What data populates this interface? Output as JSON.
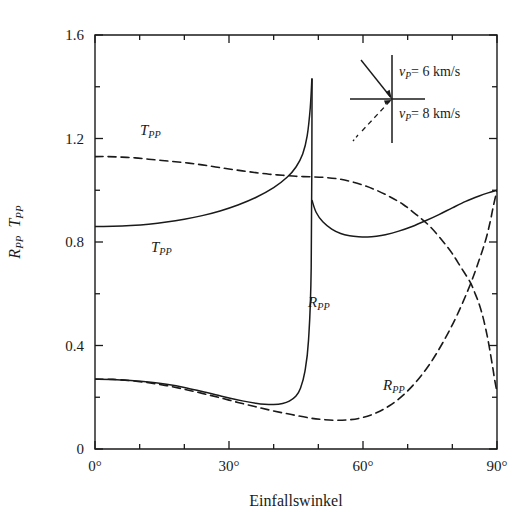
{
  "figure": {
    "background": "#ffffff",
    "ink_color": "#1a1a1a"
  },
  "axes": {
    "x_title": "Einfallswinkel",
    "y_title_r": "R",
    "y_title_r_sub": "PP",
    "y_title_t": "T",
    "y_title_t_sub": "PP",
    "x_tick_labels": [
      "0°",
      "30°",
      "60°",
      "90°"
    ],
    "y_tick_labels": [
      "0",
      "0.4",
      "0.8",
      "1.2",
      "1.6"
    ]
  },
  "curve_labels": {
    "t_pp_dashed": {
      "base": "T",
      "sub": "PP"
    },
    "t_pp_solid": {
      "base": "T",
      "sub": "PP"
    },
    "r_pp_solid": {
      "base": "R",
      "sub": "PP"
    },
    "r_pp_dashed": {
      "base": "R",
      "sub": "PP"
    }
  },
  "legend": {
    "upper_medium": {
      "symbol": "v",
      "symbol_sub": "P",
      "equals": "=",
      "value": "6 km/s"
    },
    "lower_medium": {
      "symbol": "v",
      "symbol_sub": "P",
      "equals": "=",
      "value": "8 km/s"
    }
  },
  "chart_data": {
    "type": "line",
    "title": "",
    "xlabel": "Einfallswinkel",
    "ylabel": "R_PP  T_PP",
    "xlim": [
      0,
      90
    ],
    "ylim": [
      0,
      1.6
    ],
    "xticks": [
      0,
      30,
      60,
      90
    ],
    "xtick_labels": [
      "0°",
      "30°",
      "60°",
      "90°"
    ],
    "xticks_minor": [
      10,
      20,
      40,
      50,
      70,
      80
    ],
    "yticks": [
      0,
      0.4,
      0.8,
      1.2,
      1.6
    ],
    "ytick_labels": [
      "0",
      "0.4",
      "0.8",
      "1.2",
      "1.6"
    ],
    "yticks_minor": [
      0.2,
      0.6,
      1.0,
      1.4
    ],
    "grid": false,
    "legend_position": "inside-top-right",
    "annotations": [
      {
        "text": "T_PP",
        "x": 10.5,
        "y": 1.225,
        "style": "dashed-curve-label"
      },
      {
        "text": "T_PP",
        "x": 13.0,
        "y": 0.775,
        "style": "solid-curve-label"
      },
      {
        "text": "R_PP",
        "x": 47.5,
        "y": 0.535,
        "style": "solid-curve-label"
      },
      {
        "text": "R_PP",
        "x": 70.0,
        "y": 0.255,
        "style": "dashed-curve-label"
      }
    ],
    "critical_angle_deg": 48.6,
    "series": [
      {
        "name": "T_PP (v_P = 8 km/s, dashed)",
        "style": "dashed",
        "x": [
          0,
          3,
          6,
          9,
          12,
          15,
          18,
          21,
          24,
          27,
          30,
          33,
          36,
          39,
          42,
          45,
          48,
          51,
          54,
          57,
          60,
          63,
          66,
          69,
          72,
          75,
          78,
          80,
          82,
          84,
          85,
          86,
          87,
          88,
          89,
          89.5,
          90
        ],
        "y": [
          1.13,
          1.13,
          1.128,
          1.125,
          1.12,
          1.115,
          1.11,
          1.105,
          1.098,
          1.09,
          1.082,
          1.075,
          1.068,
          1.062,
          1.058,
          1.054,
          1.052,
          1.05,
          1.045,
          1.035,
          1.02,
          1.0,
          0.975,
          0.945,
          0.905,
          0.86,
          0.8,
          0.755,
          0.7,
          0.645,
          0.605,
          0.56,
          0.5,
          0.42,
          0.32,
          0.265,
          0.22
        ]
      },
      {
        "name": "T_PP (v_P = 6 km/s, solid)",
        "style": "solid",
        "x": [
          0,
          4,
          8,
          12,
          16,
          20,
          24,
          28,
          32,
          36,
          40,
          43,
          45,
          46.5,
          47.5,
          48.2,
          48.55
        ],
        "y": [
          0.86,
          0.861,
          0.864,
          0.869,
          0.877,
          0.888,
          0.902,
          0.92,
          0.943,
          0.972,
          1.01,
          1.05,
          1.09,
          1.14,
          1.21,
          1.32,
          1.43
        ]
      },
      {
        "name": "R_PP (v_P = 6 km/s, solid, post-critical branch)",
        "style": "solid",
        "x": [
          48.6,
          49.5,
          51,
          53,
          55,
          57,
          59,
          61,
          63,
          65,
          68,
          71,
          74,
          77,
          80,
          83,
          86,
          88,
          90
        ],
        "y": [
          0.96,
          0.915,
          0.878,
          0.85,
          0.833,
          0.824,
          0.82,
          0.819,
          0.822,
          0.828,
          0.842,
          0.86,
          0.882,
          0.906,
          0.932,
          0.957,
          0.978,
          0.99,
          1.0
        ]
      },
      {
        "name": "R_PP (v_P = 6 km/s, solid, pre-critical branch)",
        "style": "solid",
        "x": [
          0,
          4,
          8,
          12,
          16,
          20,
          24,
          27,
          30,
          33,
          36,
          38,
          40,
          42,
          43.5,
          45,
          46,
          47,
          47.8,
          48.4,
          48.6
        ],
        "y": [
          0.27,
          0.269,
          0.265,
          0.259,
          0.25,
          0.238,
          0.222,
          0.21,
          0.197,
          0.186,
          0.177,
          0.173,
          0.172,
          0.176,
          0.185,
          0.205,
          0.235,
          0.3,
          0.42,
          0.7,
          1.43
        ]
      },
      {
        "name": "R_PP (v_P = 8 km/s, dashed)",
        "style": "dashed",
        "x": [
          0,
          4,
          8,
          12,
          16,
          20,
          24,
          28,
          32,
          36,
          40,
          44,
          48,
          51,
          54,
          57,
          60,
          63,
          66,
          69,
          72,
          75,
          78,
          81,
          84,
          86,
          87.5,
          88.5,
          89.2,
          90
        ],
        "y": [
          0.27,
          0.269,
          0.264,
          0.256,
          0.245,
          0.231,
          0.215,
          0.198,
          0.18,
          0.163,
          0.147,
          0.133,
          0.12,
          0.114,
          0.111,
          0.113,
          0.122,
          0.14,
          0.168,
          0.208,
          0.262,
          0.33,
          0.415,
          0.515,
          0.635,
          0.73,
          0.81,
          0.88,
          0.94,
          1.0
        ]
      }
    ]
  }
}
